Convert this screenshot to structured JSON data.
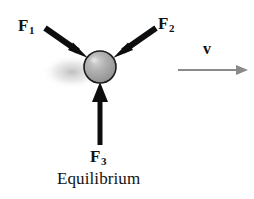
{
  "figure": {
    "caption": "Equilibrium",
    "background_color": "#ffffff"
  },
  "labels": {
    "f1": {
      "symbol": "F",
      "subscript": "1",
      "text": "F1"
    },
    "f2": {
      "symbol": "F",
      "subscript": "2",
      "text": "F2"
    },
    "f3": {
      "symbol": "F",
      "subscript": "3",
      "text": "F3"
    },
    "velocity": {
      "symbol": "v",
      "text": "v"
    }
  },
  "colors": {
    "force_arrow": "#0d0d0d",
    "velocity_arrow": "#8a8a8a",
    "ball_fill": "#a9a9a9",
    "ball_outline": "#1a1a1a",
    "ball_highlight": "#d8d8d8",
    "blur_shadow": "#c9c9c9",
    "text": "#111111"
  },
  "geometry": {
    "ball": {
      "cx": 100,
      "cy": 67,
      "r": 16
    },
    "arrows": [
      {
        "name": "f1",
        "x1": 45,
        "y1": 28,
        "x2": 88,
        "y2": 58,
        "color": "#0d0d0d",
        "width": 6
      },
      {
        "name": "f2",
        "x1": 156,
        "y1": 28,
        "x2": 113,
        "y2": 58,
        "color": "#0d0d0d",
        "width": 6
      },
      {
        "name": "f3",
        "x1": 100,
        "y1": 145,
        "x2": 100,
        "y2": 84,
        "color": "#0d0d0d",
        "width": 5
      },
      {
        "name": "velocity",
        "x1": 178,
        "y1": 70,
        "x2": 247,
        "y2": 70,
        "color": "#8a8a8a",
        "width": 2
      }
    ]
  }
}
